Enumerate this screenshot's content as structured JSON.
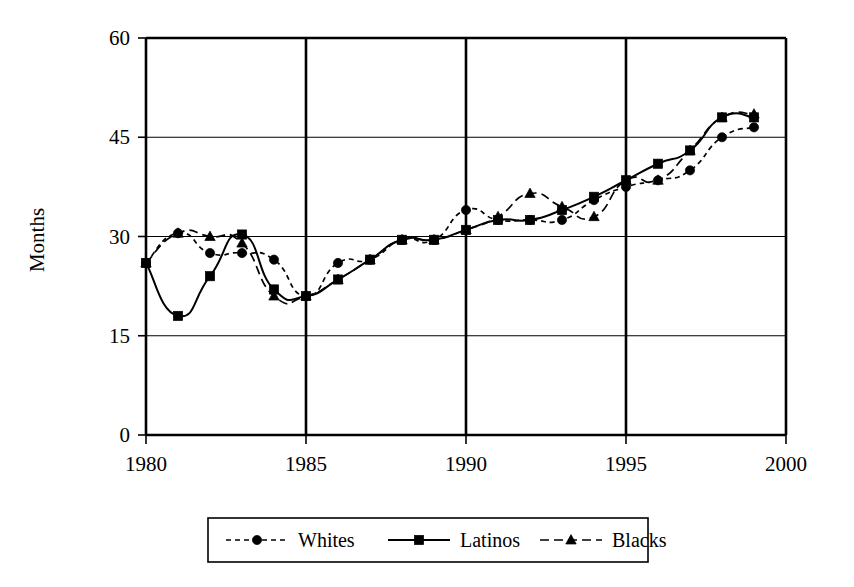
{
  "chart_data": {
    "type": "line",
    "title": "",
    "subtitle": "",
    "xlabel": "",
    "ylabel": "Months",
    "xlim": [
      1980,
      2000
    ],
    "ylim": [
      0,
      60
    ],
    "xticks": [
      "1980",
      "1985",
      "1990",
      "1995",
      "2000"
    ],
    "xtick_values": [
      1980,
      1985,
      1990,
      1995,
      2000
    ],
    "yticks": [
      "0",
      "15",
      "30",
      "45",
      "60"
    ],
    "ytick_values": [
      0,
      15,
      30,
      45,
      60
    ],
    "grid": "horizontal-gridlines-and-vertical-year-lines",
    "legend_position": "bottom-center",
    "x": [
      1980,
      1981,
      1982,
      1983,
      1984,
      1985,
      1986,
      1987,
      1988,
      1989,
      1990,
      1991,
      1992,
      1993,
      1994,
      1995,
      1996,
      1997,
      1998,
      1999
    ],
    "series": [
      {
        "name": "Whites",
        "marker": "circle",
        "dash": "dotted",
        "color": "#000000",
        "values": [
          26.0,
          30.5,
          27.5,
          27.5,
          26.5,
          21.0,
          26.0,
          26.5,
          29.5,
          29.5,
          34.0,
          32.5,
          32.5,
          32.5,
          35.5,
          37.5,
          38.5,
          40.0,
          45.0,
          46.5
        ]
      },
      {
        "name": "Latinos",
        "marker": "square",
        "dash": "solid",
        "color": "#000000",
        "values": [
          26.0,
          18.0,
          24.0,
          30.3,
          22.0,
          21.0,
          23.5,
          26.5,
          29.5,
          29.5,
          31.0,
          32.5,
          32.5,
          34.0,
          36.0,
          38.5,
          41.0,
          43.0,
          48.0,
          48.0
        ]
      },
      {
        "name": "Blacks",
        "marker": "triangle",
        "dash": "dashed",
        "color": "#000000",
        "values": [
          26.0,
          30.5,
          30.0,
          29.0,
          21.0,
          21.0,
          23.5,
          26.5,
          29.5,
          29.5,
          31.0,
          33.0,
          36.5,
          34.5,
          33.0,
          38.5,
          38.5,
          43.0,
          48.0,
          48.5
        ]
      }
    ]
  },
  "axes": {
    "y_title": "Months"
  },
  "legend": {
    "items": [
      {
        "label": "Whites",
        "marker": "circle-marker",
        "style": "dotted"
      },
      {
        "label": "Latinos",
        "marker": "square-marker",
        "style": "solid"
      },
      {
        "label": "Blacks",
        "marker": "triangle-marker",
        "style": "dashed"
      }
    ]
  }
}
